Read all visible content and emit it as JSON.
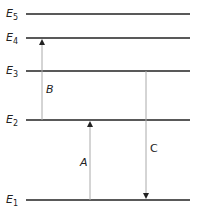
{
  "diagram": {
    "type": "energy-level-diagram",
    "levels": [
      {
        "name": "E",
        "sub": "5",
        "y": 14
      },
      {
        "name": "E",
        "sub": "4",
        "y": 38
      },
      {
        "name": "E",
        "sub": "3",
        "y": 71
      },
      {
        "name": "E",
        "sub": "2",
        "y": 120
      },
      {
        "name": "E",
        "sub": "1",
        "y": 200
      }
    ],
    "transitions": [
      {
        "label": "A",
        "from": "E1",
        "to": "E2",
        "direction": "up"
      },
      {
        "label": "B",
        "from": "E2",
        "to": "E4",
        "direction": "up"
      },
      {
        "label": "C",
        "from": "E3",
        "to": "E1",
        "direction": "down"
      }
    ],
    "colors": {
      "level_line": "#222222",
      "arrow": "#999999",
      "text": "#222222"
    }
  }
}
